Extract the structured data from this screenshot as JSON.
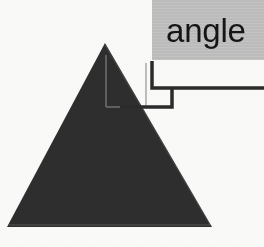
{
  "diagram": {
    "kind": "geometry-illustration",
    "background_color": "#fbfbfa"
  },
  "callout": {
    "label": "angle",
    "box_color": "#c2c2c2",
    "text_color": "#151515",
    "leader_color": "#2b2b2b"
  },
  "shape": {
    "name": "triangle",
    "fill_color": "#2e2e2e",
    "apex": {
      "x": 105,
      "y": 43
    },
    "base_left": {
      "x": 7,
      "y": 227
    },
    "base_right": {
      "x": 212,
      "y": 227
    }
  },
  "angle_marker": {
    "name": "apex-angle-marker",
    "color": "#6a6a6a",
    "vertical_x": 106,
    "horizontal_y": 107,
    "right_x": 146
  },
  "leader_line": {
    "points": "152,62 152,88 264,88",
    "points_lower": "172,88 172,107 120,107"
  }
}
